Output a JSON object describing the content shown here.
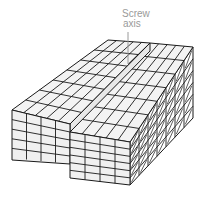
{
  "diagram": {
    "label": {
      "line1": "Screw",
      "line2": "axis"
    },
    "colors": {
      "line": "#1a1a1a",
      "face_top": "#f3f3f3",
      "face_front": "#f0f0f0",
      "face_side": "#ffffff",
      "label": "#9a9a9a",
      "axis": "#9a9a9a"
    },
    "grid": {
      "top_rows": 7,
      "top_cols": 10,
      "front_rows": 5,
      "side_cols": 7
    }
  }
}
